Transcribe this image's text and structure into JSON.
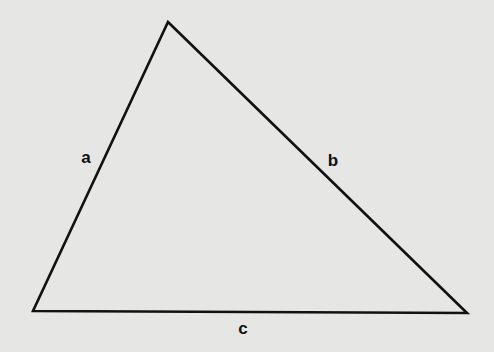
{
  "diagram": {
    "type": "triangle",
    "background": "#e6e6e4",
    "stroke_color": "#111111",
    "vertices": {
      "top": [
        168,
        22
      ],
      "bottom_left": [
        33,
        311
      ],
      "bottom_right": [
        467,
        313
      ]
    },
    "sides": [
      {
        "id": "a",
        "label": "a",
        "from": "bottom_left",
        "to": "top",
        "label_pos": [
          86,
          157
        ]
      },
      {
        "id": "b",
        "label": "b",
        "from": "top",
        "to": "bottom_right",
        "label_pos": [
          333,
          160
        ]
      },
      {
        "id": "c",
        "label": "c",
        "from": "bottom_left",
        "to": "bottom_right",
        "label_pos": [
          243,
          328
        ]
      }
    ]
  }
}
